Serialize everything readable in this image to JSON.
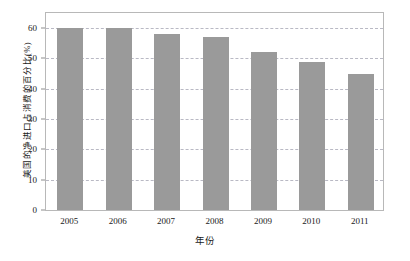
{
  "chart_data": {
    "type": "bar",
    "title": "",
    "categories": [
      "2005",
      "2006",
      "2007",
      "2008",
      "2009",
      "2010",
      "2011"
    ],
    "values": [
      60,
      60,
      58,
      57,
      52,
      49,
      45
    ],
    "xlabel": "年份",
    "ylabel": "美国的净进口占消费的百分比(%)",
    "ylim": [
      0,
      65
    ],
    "yticks": [
      0,
      10,
      20,
      30,
      40,
      50,
      60
    ],
    "ytick_labels": [
      "0",
      "10",
      "20",
      "30",
      "40",
      "50",
      "60"
    ],
    "grid": true,
    "grid_axis": "y",
    "grid_style": "dashed",
    "legend": null,
    "bar_color": "#9a9a9a",
    "frame_color": "#b8b8b8",
    "grid_color": "#b9b9c4",
    "background_color": "#ffffff"
  }
}
